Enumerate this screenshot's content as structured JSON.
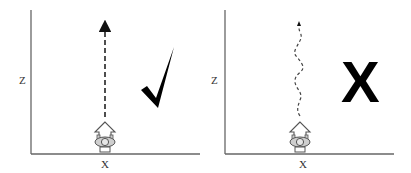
{
  "panels": [
    {
      "id": "correct",
      "y_axis_label": "Z",
      "x_axis_label": "X",
      "path_style": "straight-dashed",
      "verdict": "correct",
      "verdict_symbol": "check-mark"
    },
    {
      "id": "incorrect",
      "y_axis_label": "Z",
      "x_axis_label": "X",
      "path_style": "wavy-dashed",
      "verdict": "incorrect",
      "verdict_symbol": "X"
    }
  ],
  "colors": {
    "axis": "#555555",
    "path": "#333333",
    "mark": "#000000",
    "robot_fill": "#dddddd",
    "robot_stroke": "#555555"
  }
}
